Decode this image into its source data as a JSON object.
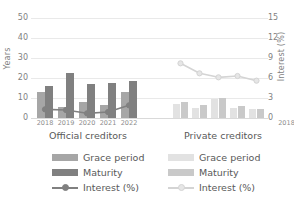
{
  "chart_data": {
    "type": "bar",
    "title": "",
    "ylabel": "Years",
    "y2label": "Interest (%)",
    "xlabel": "",
    "ylim": [
      0,
      55
    ],
    "y2lim": [
      0,
      16.5
    ],
    "yticks": [
      50,
      40,
      30,
      20,
      10,
      0
    ],
    "y2ticks": [
      15,
      12,
      9,
      6,
      3,
      0
    ],
    "grid": true,
    "categories": [
      "2018",
      "2019",
      "2020",
      "2021",
      "2022"
    ],
    "panels": [
      {
        "name": "official",
        "caption": "Official creditors",
        "categories": [
          "2018",
          "2019",
          "2020",
          "2021",
          "2022"
        ],
        "series": [
          {
            "name": "Grace period",
            "axis": "left",
            "color": "#a6a6a6",
            "values": [
              13.0,
              5.5,
              8.0,
              6.5,
              13.0
            ]
          },
          {
            "name": "Maturity",
            "axis": "left",
            "color": "#808080",
            "values": [
              16.0,
              22.5,
              17.0,
              17.5,
              18.5
            ]
          },
          {
            "name": "Interest (%)",
            "axis": "right",
            "color": "#808080",
            "values": [
              1.3,
              1.2,
              0.7,
              0.9,
              1.9
            ]
          }
        ]
      },
      {
        "name": "private",
        "caption": "Private creditors",
        "categories": [
          "2018",
          "2019",
          "2020",
          "2021",
          "2022"
        ],
        "series": [
          {
            "name": "Grace period",
            "axis": "left",
            "color": "#e2e2e2",
            "values": [
              7.0,
              5.0,
              9.5,
              5.0,
              4.5
            ]
          },
          {
            "name": "Maturity",
            "axis": "left",
            "color": "#c9c9c9",
            "values": [
              8.0,
              6.5,
              10.0,
              6.0,
              4.5
            ]
          },
          {
            "name": "Interest (%)",
            "axis": "right",
            "color": "#d4d4d4",
            "values": [
              8.2,
              6.7,
              6.1,
              6.3,
              5.6
            ]
          }
        ]
      }
    ],
    "legends": [
      {
        "name": "official",
        "entries": [
          {
            "label": "Grace period",
            "type": "bar",
            "color": "#a6a6a6"
          },
          {
            "label": "Maturity",
            "type": "bar",
            "color": "#808080"
          },
          {
            "label": "Interest (%)",
            "type": "line",
            "color": "#808080"
          }
        ]
      },
      {
        "name": "private",
        "entries": [
          {
            "label": "Grace period",
            "type": "bar",
            "color": "#e2e2e2"
          },
          {
            "label": "Maturity",
            "type": "bar",
            "color": "#c9c9c9"
          },
          {
            "label": "Interest (%)",
            "type": "line",
            "color": "#d4d4d4"
          }
        ]
      }
    ]
  },
  "axes": {
    "left_title": "Years",
    "right_title": "Interest (%)",
    "left_ticks": [
      "50",
      "40",
      "30",
      "20",
      "10",
      "0"
    ],
    "right_ticks": [
      "15",
      "12",
      "9",
      "6",
      "3",
      "0"
    ]
  },
  "captions": {
    "official": "Official creditors",
    "private": "Private creditors"
  }
}
